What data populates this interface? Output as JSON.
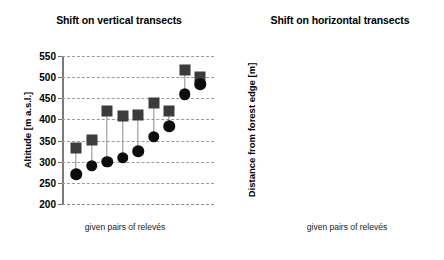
{
  "figure": {
    "xlabel_common": "given pairs of relevés"
  },
  "chart_data": [
    {
      "type": "scatter",
      "id": "vertical-transects",
      "title": "Shift on vertical transects",
      "xlabel": "given pairs of relevés",
      "ylabel": "Altitude [m a.s.l.]",
      "ylim": [
        200,
        550
      ],
      "yticks": [
        200,
        250,
        300,
        350,
        400,
        450,
        500,
        550
      ],
      "ytick_labels": [
        "200",
        "250",
        "300",
        "350",
        "400",
        "450",
        "500",
        "550"
      ],
      "grid": true,
      "grid_axis": "y",
      "legend": "none",
      "xticks": [],
      "xtick_labels": [],
      "marker_upper": "square",
      "marker_lower": "circle",
      "colors": {
        "square": "#3b3b3b",
        "circle": "#0d0d0d",
        "connector": "#8c8c8c",
        "grid": "#9a9a9a",
        "axis": "#7a7a7a"
      },
      "pairs": [
        {
          "index": 1,
          "upper": 333,
          "lower": 270
        },
        {
          "index": 2,
          "upper": 351,
          "lower": 290
        },
        {
          "index": 3,
          "upper": 419,
          "lower": 300
        },
        {
          "index": 4,
          "upper": 408,
          "lower": 309
        },
        {
          "index": 5,
          "upper": 410,
          "lower": 325
        },
        {
          "index": 6,
          "upper": 439,
          "lower": 359
        },
        {
          "index": 7,
          "upper": 419,
          "lower": 384
        },
        {
          "index": 8,
          "upper": 516,
          "lower": 460
        },
        {
          "index": 9,
          "upper": 500,
          "lower": 483
        }
      ],
      "series": [
        {
          "name": "upper (square)",
          "values": [
            333,
            351,
            419,
            408,
            410,
            439,
            419,
            516,
            500
          ]
        },
        {
          "name": "lower (circle)",
          "values": [
            270,
            290,
            300,
            309,
            325,
            359,
            384,
            460,
            483
          ]
        }
      ]
    },
    {
      "type": "scatter",
      "id": "horizontal-transects",
      "title": "Shift on horizontal transects",
      "xlabel": "given pairs of relevés",
      "ylabel": "Distance from forest edge [m]",
      "ylim": [
        0,
        450
      ],
      "yticks": [
        0,
        50,
        100,
        150,
        200,
        250,
        300,
        350,
        400,
        450
      ],
      "ytick_labels": [
        "0",
        "50",
        "100",
        "150",
        "200",
        "250",
        "300",
        "350",
        "400",
        "450"
      ],
      "grid": true,
      "grid_axis": "y",
      "legend": "none",
      "xticks": [],
      "xtick_labels": [],
      "marker_upper": "square",
      "marker_lower": "circle",
      "colors": {
        "square": "#3b3b3b",
        "circle": "#0d0d0d",
        "connector": "#8c8c8c",
        "grid": "#9a9a9a",
        "axis": "#7a7a7a"
      },
      "pairs": [
        {
          "index": 1,
          "upper": 270,
          "lower": 20
        },
        {
          "index": 2,
          "upper": 278,
          "lower": 25
        },
        {
          "index": 3,
          "upper": 320,
          "lower": 70
        },
        {
          "index": 4,
          "upper": 324,
          "lower": 75
        },
        {
          "index": 5,
          "upper": 360,
          "lower": 121
        },
        {
          "index": 6,
          "upper": 395,
          "lower": 180
        }
      ],
      "series": [
        {
          "name": "upper (square)",
          "values": [
            270,
            278,
            320,
            324,
            360,
            395
          ]
        },
        {
          "name": "lower (circle)",
          "values": [
            20,
            25,
            70,
            75,
            121,
            180
          ]
        }
      ]
    }
  ]
}
